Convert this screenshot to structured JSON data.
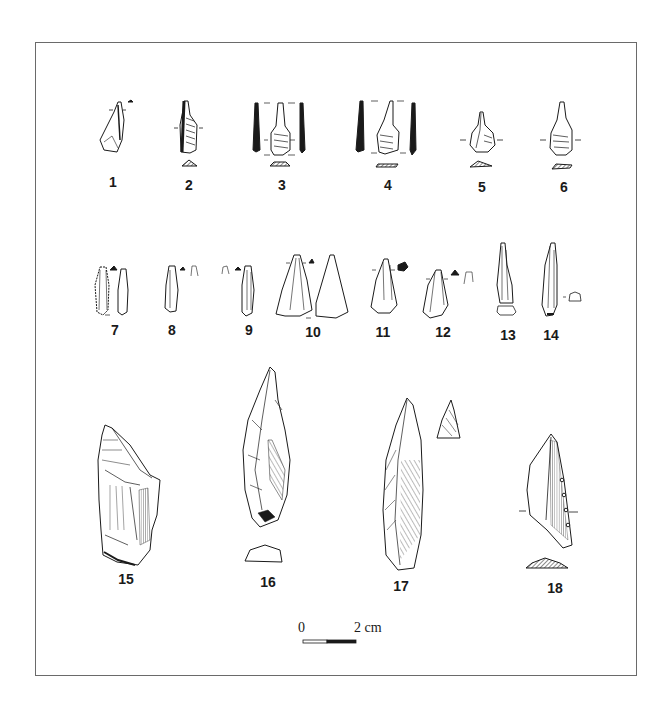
{
  "figure": {
    "type": "archaeological lithic artifact plate",
    "artifacts": [
      {
        "id": "1",
        "label": "1",
        "x": 113,
        "y": 181
      },
      {
        "id": "2",
        "label": "2",
        "x": 189,
        "y": 184
      },
      {
        "id": "3",
        "label": "3",
        "x": 282,
        "y": 184
      },
      {
        "id": "4",
        "label": "4",
        "x": 388,
        "y": 184
      },
      {
        "id": "5",
        "label": "5",
        "x": 482,
        "y": 186
      },
      {
        "id": "6",
        "label": "6",
        "x": 564,
        "y": 186
      },
      {
        "id": "7",
        "label": "7",
        "x": 115,
        "y": 324
      },
      {
        "id": "8",
        "label": "8",
        "x": 172,
        "y": 324
      },
      {
        "id": "9",
        "label": "9",
        "x": 249,
        "y": 324
      },
      {
        "id": "10",
        "label": "10",
        "x": 313,
        "y": 326
      },
      {
        "id": "11",
        "label": "11",
        "x": 383,
        "y": 326
      },
      {
        "id": "12",
        "label": "12",
        "x": 443,
        "y": 326
      },
      {
        "id": "13",
        "label": "13",
        "x": 508,
        "y": 330
      },
      {
        "id": "14",
        "label": "14",
        "x": 551,
        "y": 330
      },
      {
        "id": "15",
        "label": "15",
        "x": 126,
        "y": 578
      },
      {
        "id": "16",
        "label": "16",
        "x": 268,
        "y": 581
      },
      {
        "id": "17",
        "label": "17",
        "x": 401,
        "y": 585
      },
      {
        "id": "18",
        "label": "18",
        "x": 555,
        "y": 587
      }
    ]
  },
  "scale_bar": {
    "start_label": "0",
    "end_label": "2 cm"
  },
  "colors": {
    "ink": "#1a1a1a",
    "frame": "#6a6a6a",
    "background": "#ffffff"
  }
}
